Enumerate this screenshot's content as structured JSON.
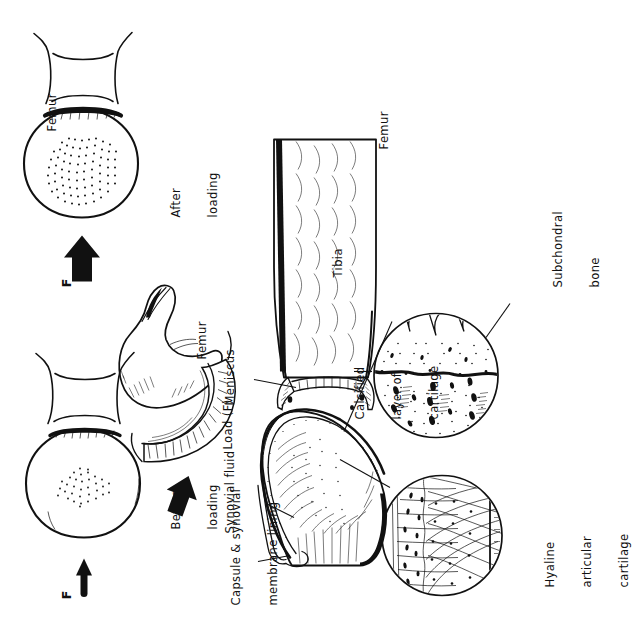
{
  "figure": {
    "orientation": "rotated-90-ccw",
    "ink_color": "#111111",
    "background_color": "#ffffff"
  },
  "panels": {
    "before_loading": {
      "force_label": "F",
      "caption_line1": "Before",
      "caption_line2": "loading",
      "arrow": "thin-right-arrow",
      "stipple_patch": "small"
    },
    "after_loading": {
      "force_label": "F",
      "caption_line1": "After",
      "caption_line2": "loading",
      "arrow": "thick-right-arrow",
      "stipple_patch": "large"
    },
    "hip_detail": {
      "bone_label": "Femur",
      "load_label": "Load (F)",
      "arrow": "thick-down-arrow"
    },
    "knee_section": {
      "capsule_label_line1": "Capsule & synovial",
      "capsule_label_line2": "membrane lining",
      "synovial_label": "Synovial fluid",
      "meniscus_label": "Meniscus",
      "tibia_label": "Tibia",
      "femur_label": "Femur"
    },
    "inset_left": {
      "label_line1": "Hyaline",
      "label_line2": "articular",
      "label_line3": "cartilage",
      "content": "collagen-fibre-arcades"
    },
    "inset_right": {
      "label_line1": "Calcified",
      "label_line2": "layer of",
      "label_line3": "cartilage",
      "subchondral_line1": "Subchondral",
      "subchondral_line2": "bone",
      "content": "tidemark-and-trabecular-bone"
    }
  }
}
